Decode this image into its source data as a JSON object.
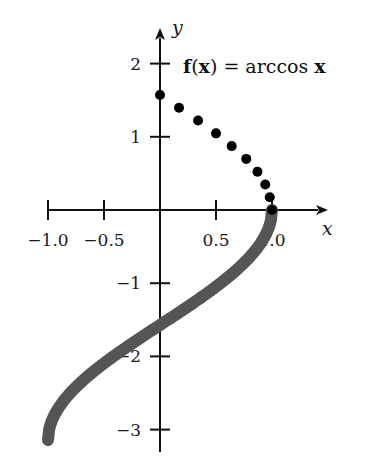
{
  "chart_data": {
    "type": "line",
    "title": "f(x) = arccos x",
    "xlabel": "x",
    "ylabel": "y",
    "xlim": [
      -1.0,
      1.1
    ],
    "ylim": [
      -3.2,
      2.4
    ],
    "grid": false,
    "legend": "none",
    "x_ticks": [
      -1.0,
      -0.5,
      0.5,
      1.0
    ],
    "x_tick_labels": [
      "−1.0",
      "−0.5",
      "0.5",
      "1.0"
    ],
    "y_ticks": [
      2,
      1,
      -1,
      -2,
      -3
    ],
    "y_tick_labels": [
      "2",
      "1",
      "−1",
      "−2",
      "−3"
    ],
    "series": [
      {
        "name": "arccos x (sampled points)",
        "style": "dots",
        "color": "#000000",
        "x": [
          0.0,
          0.17,
          0.34,
          0.5,
          0.64,
          0.77,
          0.87,
          0.94,
          0.98,
          1.0
        ],
        "y": [
          1.571,
          1.396,
          1.222,
          1.047,
          0.873,
          0.698,
          0.524,
          0.349,
          0.175,
          0.0
        ]
      },
      {
        "name": "-arccos x (curve)",
        "style": "thick-line",
        "color": "#555555",
        "x": [
          -1.0,
          -0.98,
          -0.94,
          -0.87,
          -0.77,
          -0.64,
          -0.5,
          -0.34,
          -0.17,
          0.0,
          0.17,
          0.34,
          0.5,
          0.64,
          0.77,
          0.87,
          0.94,
          0.98,
          1.0
        ],
        "y": [
          -3.142,
          -2.967,
          -2.793,
          -2.618,
          -2.443,
          -2.269,
          -2.094,
          -1.92,
          -1.745,
          -1.571,
          -1.396,
          -1.222,
          -1.047,
          -0.873,
          -0.698,
          -0.524,
          -0.349,
          -0.175,
          0.0
        ]
      }
    ]
  },
  "labels": {
    "title_f": "f",
    "title_open": "(",
    "title_x": "x",
    "title_close": ")",
    "title_eq": " = arccos ",
    "title_x2": "x",
    "x_axis": "x",
    "y_axis": "y"
  }
}
